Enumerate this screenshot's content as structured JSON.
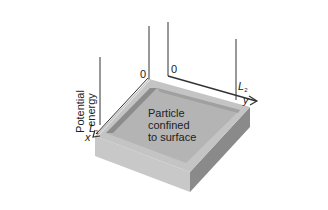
{
  "diagram": {
    "y_axis_label_line1": "Potential",
    "y_axis_label_line2": "energy",
    "x_axis": {
      "origin": "0",
      "end_label": "L",
      "end_subscript": "1",
      "axis_name": "x"
    },
    "y_axis": {
      "origin": "0",
      "end_label": "L",
      "end_subscript": "2",
      "axis_name": "y"
    },
    "surface_label_line1": "Particle",
    "surface_label_line2": "confined",
    "surface_label_line3": "to surface",
    "colors": {
      "background": "#ffffff",
      "top_surface": "#b4b4b4",
      "rim": "#c4c4c4",
      "rim_shadow": "#8c8c8c",
      "front_left_face": "#c8c8c8",
      "front_right_face": "#8a8a8a",
      "lines": "#333333",
      "text": "#222222"
    }
  }
}
